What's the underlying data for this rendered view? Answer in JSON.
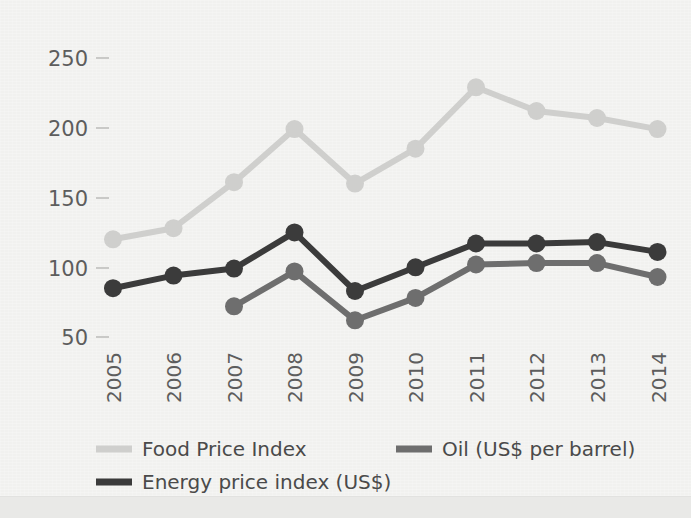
{
  "figure": {
    "background_color": "#f1f1ef",
    "plot_area": {
      "left": 100,
      "top": 40,
      "right": 683,
      "bottom": 345
    }
  },
  "chart_data": {
    "type": "line",
    "title": "",
    "subtitle": "",
    "xlabel": "",
    "ylabel": "",
    "categories": [
      "2005",
      "2006",
      "2007",
      "2008",
      "2009",
      "2010",
      "2011",
      "2012",
      "2013",
      "2014"
    ],
    "x_tick_rotation": 90,
    "ylim": [
      50,
      250
    ],
    "yticks": [
      50,
      100,
      150,
      200,
      250
    ],
    "grid": false,
    "legend_position": "bottom",
    "markers": "circle",
    "series": [
      {
        "name": "Food Price Index",
        "color": "#cfcfcd",
        "values": [
          120,
          128,
          161,
          199,
          160,
          185,
          229,
          212,
          207,
          199
        ]
      },
      {
        "name": "Energy price index (US$)",
        "color": "#3b3b3b",
        "values": [
          85,
          94,
          99,
          125,
          83,
          100,
          117,
          117,
          118,
          111
        ]
      },
      {
        "name": "Oil (US$ per barrel)",
        "color": "#6e6e6e",
        "values": [
          null,
          null,
          72,
          97,
          62,
          78,
          102,
          103,
          103,
          93
        ]
      }
    ]
  },
  "axes": {
    "y_tick_labels": [
      "250",
      "200",
      "150",
      "100",
      "50"
    ],
    "x_tick_labels": [
      "2005",
      "2006",
      "2007",
      "2008",
      "2009",
      "2010",
      "2011",
      "2012",
      "2013",
      "2014"
    ]
  },
  "legend": {
    "entries": [
      {
        "label": "Food Price Index",
        "color": "#cfcfcd",
        "row": 0,
        "col": 0
      },
      {
        "label": "Oil (US$ per barrel)",
        "color": "#6e6e6e",
        "row": 0,
        "col": 1
      },
      {
        "label": "Energy price index (US$)",
        "color": "#3b3b3b",
        "row": 1,
        "col": 0
      }
    ]
  }
}
